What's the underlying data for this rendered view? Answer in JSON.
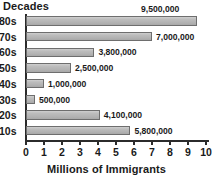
{
  "chart_data": {
    "type": "bar",
    "orientation": "horizontal",
    "title": "Decades",
    "xlabel": "Millions of Immigrants",
    "ylabel": "Decades",
    "xlim": [
      0,
      10
    ],
    "grid": false,
    "legend": "none",
    "xticks": [
      "0",
      "1",
      "2",
      "3",
      "4",
      "5",
      "6",
      "7",
      "8",
      "9",
      "10"
    ],
    "categories": [
      "80s",
      "70s",
      "60s",
      "50s",
      "40s",
      "30s",
      "20s",
      "10s"
    ],
    "values": [
      9500000,
      7000000,
      3800000,
      2500000,
      1000000,
      500000,
      4100000,
      5800000
    ],
    "values_millions": [
      9.5,
      7.0,
      3.8,
      2.5,
      1.0,
      0.5,
      4.1,
      5.8
    ],
    "data_labels": [
      "9,500,000",
      "7,000,000",
      "3,800,000",
      "2,500,000",
      "1,000,000",
      "500,000",
      "4,100,000",
      "5,800,000"
    ],
    "label_placement": [
      "above",
      "right",
      "right",
      "right",
      "right",
      "right",
      "right",
      "right"
    ],
    "bar_fill": "#b8b8b8",
    "bar_border": "#6e6e6e",
    "axis_color": "#2b2b2b",
    "background": "#ffffff"
  }
}
